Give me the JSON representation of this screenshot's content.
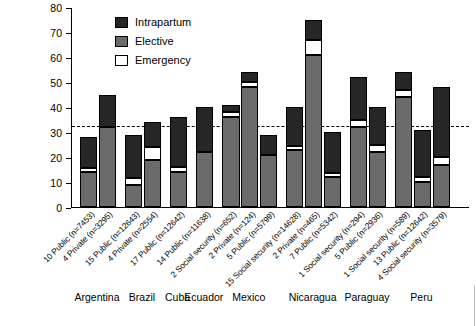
{
  "chart_data": {
    "type": "bar",
    "title": "",
    "subtitle": "",
    "xlabel": "",
    "ylabel": "",
    "ylim": [
      0,
      80
    ],
    "yticks": [
      0,
      10,
      20,
      30,
      40,
      50,
      60,
      70,
      80
    ],
    "grid": false,
    "stacked": true,
    "legend_position": "top-left",
    "legend": [
      "Intrapartum",
      "Elective",
      "Emergency"
    ],
    "annotations": [
      {
        "type": "reference-line",
        "style": "dashed",
        "y": 33,
        "label": ""
      }
    ],
    "series": [
      {
        "name": "Elective",
        "values": [
          14,
          32,
          9,
          19,
          14,
          22,
          36,
          48,
          21,
          23,
          61,
          12,
          32,
          22,
          44,
          10,
          17
        ]
      },
      {
        "name": "Emergency",
        "values": [
          1.5,
          0,
          2.5,
          5,
          2,
          0,
          2,
          2,
          0,
          1.5,
          6,
          1.5,
          3,
          3,
          3,
          2,
          3
        ]
      },
      {
        "name": "Intrapartum",
        "values": [
          12.5,
          13,
          17.5,
          10,
          20,
          18,
          3,
          4,
          8,
          15.5,
          8,
          16.5,
          17,
          15,
          7,
          19,
          28
        ]
      }
    ],
    "totals": [
      28,
      45,
      29,
      34,
      36,
      40,
      41,
      54,
      29,
      40,
      75,
      30,
      52,
      40,
      54,
      31,
      48
    ],
    "categories": [
      "10 Public (n=7453)",
      "4 Private (n=3295)",
      "15 Public (n=12643)",
      "4 Private (n=2554)",
      "17 Public (n=12642)",
      "14 Public (n=11638)",
      "2 Social security (n=652)",
      "2 Private (n=124)",
      "5 Public (n=5799)",
      "15 Social security (n=14628)",
      "2 Private (n=465)",
      "7 Public (n=5342)",
      "1 Social security (n=294)",
      "5 Public (n=2936)",
      "1 Social security (n=589)",
      "13 Public (n=12642)",
      "4 Social security (n=3579)"
    ],
    "groups": [
      {
        "label": "Argentina",
        "bars": [
          0,
          1
        ]
      },
      {
        "label": "Brazil",
        "bars": [
          2,
          3
        ]
      },
      {
        "label": "Cuba",
        "bars": [
          4
        ]
      },
      {
        "label": "Ecuador",
        "bars": [
          5
        ]
      },
      {
        "label": "Mexico",
        "bars": [
          6,
          7,
          8
        ]
      },
      {
        "label": "Nicaragua",
        "bars": [
          9,
          10,
          11
        ]
      },
      {
        "label": "Paraguay",
        "bars": [
          12,
          13
        ]
      },
      {
        "label": "Peru",
        "bars": [
          14,
          15,
          16
        ]
      }
    ],
    "colors": {
      "intrapartum": "#262626",
      "elective": "#6b6b6b",
      "emergency": "#ffffff",
      "axis": "#000000",
      "refline": "#000000"
    }
  },
  "legend": {
    "items": [
      {
        "label": "Intrapartum",
        "swatch": "dark-square-swatch"
      },
      {
        "label": "Elective",
        "swatch": "gray-square-swatch"
      },
      {
        "label": "Emergency",
        "swatch": "white-square-swatch"
      }
    ]
  },
  "group_labels": [
    "Argentina",
    "Brazil",
    "Cuba",
    "Ecuador",
    "Mexico",
    "Nicaragua",
    "Paraguay",
    "Peru"
  ]
}
